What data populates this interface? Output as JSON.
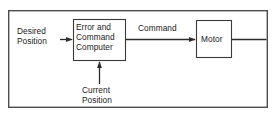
{
  "diagram": {
    "type": "block-diagram",
    "border": {
      "name": "outer-frame",
      "x": 8,
      "y": 10,
      "width": 260,
      "height": 98,
      "stroke": "#4d4d4d",
      "stroke_width": 1.4
    },
    "colors": {
      "line": "#2b2b2b",
      "box_stroke": "#3a3a3a",
      "frame_stroke": "#4d4d4d",
      "text": "#1a1a1a",
      "background": "#ffffff"
    },
    "blocks": [
      {
        "id": "computer",
        "name": "error-and-command-computer-block",
        "label": "Error and\nCommand\nComputer",
        "label_lines": [
          "Error and",
          "Command",
          "Computer"
        ],
        "x": 73,
        "y": 19,
        "width": 53,
        "height": 42
      },
      {
        "id": "motor",
        "name": "motor-block",
        "label": "Motor",
        "label_lines": [
          "Motor"
        ],
        "x": 196,
        "y": 20,
        "width": 36,
        "height": 38
      }
    ],
    "signals": [
      {
        "id": "desired-position",
        "name": "desired-position-signal",
        "label": "Desired\nPosition",
        "label_lines": [
          "Desired",
          "Position"
        ],
        "direction": "right",
        "from": [
          60,
          39
        ],
        "to": [
          73,
          39
        ],
        "arrowhead": true
      },
      {
        "id": "command",
        "name": "command-signal",
        "label": "Command",
        "label_lines": [
          "Command"
        ],
        "direction": "right",
        "from": [
          126,
          39
        ],
        "to": [
          196,
          39
        ],
        "arrowhead": true
      },
      {
        "id": "current-position",
        "name": "current-position-signal",
        "label": "Current\nPosition",
        "label_lines": [
          "Current",
          "Position"
        ],
        "direction": "up",
        "from": [
          99,
          84
        ],
        "to": [
          99,
          61
        ],
        "arrowhead": true
      },
      {
        "id": "motor-output",
        "name": "motor-output-signal",
        "label": "",
        "label_lines": [],
        "direction": "right",
        "from": [
          232,
          39
        ],
        "to": [
          267,
          39
        ],
        "arrowhead": false
      }
    ]
  }
}
